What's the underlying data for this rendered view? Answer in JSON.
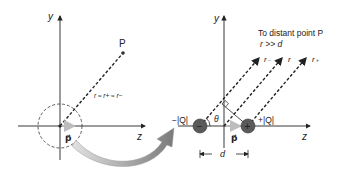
{
  "left_panel": {
    "y_axis_label": "y",
    "z_axis_label": "z",
    "point_label": "P",
    "distance_relation": "r ≈ r+ ≈ r−",
    "dipole_label": "p⃗"
  },
  "right_panel": {
    "y_axis_label": "y",
    "z_axis_label": "z",
    "caption_line1": "To distant point P",
    "caption_line2": "r >> d",
    "ray_labels": [
      "r₋",
      "r",
      "r₊"
    ],
    "negative_charge_label": "−|Q|",
    "positive_charge_label": "+|Q|",
    "negative_symbol": "−",
    "positive_symbol": "+",
    "angle_label": "θ",
    "dipole_label": "p⃗",
    "separation_label": "d"
  },
  "colors": {
    "axis": "#222222",
    "charge_fill": "#5a5a5a",
    "dipole_arrow": "#c8c8c8",
    "curved_arrow_dark": "#7a7a7a",
    "curved_arrow_light": "#d8d8d8"
  }
}
